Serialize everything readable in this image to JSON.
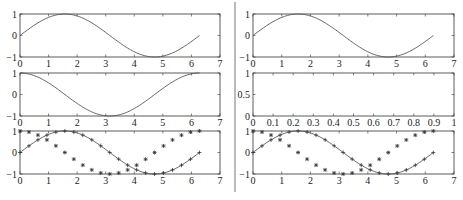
{
  "chart_data": [
    {
      "type": "line",
      "panel": "left-top",
      "title": "",
      "xlabel": "",
      "ylabel": "",
      "xlim": [
        0,
        7
      ],
      "ylim": [
        -1,
        1
      ],
      "xticks": [
        "0",
        "1",
        "2",
        "3",
        "4",
        "5",
        "6",
        "7"
      ],
      "yticks": [
        "-1",
        "0",
        "1"
      ],
      "series": [
        {
          "name": "sin(x)",
          "function": "sin",
          "x_range": [
            0,
            6.283
          ],
          "style": "solid"
        }
      ]
    },
    {
      "type": "line",
      "panel": "left-middle",
      "title": "",
      "xlabel": "",
      "ylabel": "",
      "xlim": [
        0,
        7
      ],
      "ylim": [
        -1,
        1
      ],
      "xticks": [
        "0",
        "1",
        "2",
        "3",
        "4",
        "5",
        "6",
        "7"
      ],
      "yticks": [
        "-1",
        "0",
        "1"
      ],
      "series": [
        {
          "name": "cos(x)",
          "function": "cos",
          "x_range": [
            0,
            6.283
          ],
          "style": "solid"
        }
      ]
    },
    {
      "type": "line",
      "panel": "left-bottom",
      "title": "",
      "xlabel": "",
      "ylabel": "",
      "xlim": [
        0,
        7
      ],
      "ylim": [
        -1,
        1
      ],
      "xticks": [
        "0",
        "1",
        "2",
        "3",
        "4",
        "5",
        "6",
        "7"
      ],
      "yticks": [
        "-1",
        "0",
        "1"
      ],
      "series": [
        {
          "name": "sin(x)",
          "function": "sin",
          "x_range": [
            0,
            6.283
          ],
          "style": "solid",
          "marker": "+",
          "marker_step": 0.314
        },
        {
          "name": "cos(x)",
          "function": "cos",
          "x_range": [
            0,
            6.283
          ],
          "style": "none",
          "marker": "*",
          "marker_step": 0.314
        }
      ]
    },
    {
      "type": "line",
      "panel": "right-top",
      "title": "",
      "xlabel": "",
      "ylabel": "",
      "xlim": [
        0,
        7
      ],
      "ylim": [
        -1,
        1
      ],
      "xticks": [
        "0",
        "1",
        "2",
        "3",
        "4",
        "5",
        "6",
        "7"
      ],
      "yticks": [
        "-1",
        "0",
        "1"
      ],
      "series": [
        {
          "name": "sin(x)",
          "function": "sin",
          "x_range": [
            0,
            6.283
          ],
          "style": "solid"
        }
      ]
    },
    {
      "type": "line",
      "panel": "right-middle",
      "title": "",
      "xlabel": "",
      "ylabel": "",
      "xlim": [
        0,
        1
      ],
      "ylim": [
        0,
        1
      ],
      "xticks": [
        "0",
        "0.1",
        "0.2",
        "0.3",
        "0.4",
        "0.5",
        "0.6",
        "0.7",
        "0.8",
        "0.9",
        "1"
      ],
      "yticks": [
        "0",
        "0.5",
        "1"
      ],
      "series": []
    },
    {
      "type": "line",
      "panel": "right-bottom",
      "title": "",
      "xlabel": "",
      "ylabel": "",
      "xlim": [
        0,
        7
      ],
      "ylim": [
        -1,
        1
      ],
      "xticks": [
        "0",
        "1",
        "2",
        "3",
        "4",
        "5",
        "6",
        "7"
      ],
      "yticks": [
        "-1",
        "0",
        "1"
      ],
      "series": [
        {
          "name": "sin(x)",
          "function": "sin",
          "x_range": [
            0,
            6.283
          ],
          "style": "solid",
          "marker": "+",
          "marker_step": 0.314
        },
        {
          "name": "cos(x)",
          "function": "cos",
          "x_range": [
            0,
            6.283
          ],
          "style": "none",
          "marker": "*",
          "marker_step": 0.314
        }
      ]
    }
  ],
  "layout": {
    "panels": [
      {
        "x0": 20,
        "x1": 220,
        "y0": 14,
        "y1": 57
      },
      {
        "x0": 20,
        "x1": 220,
        "y0": 73,
        "y1": 116
      },
      {
        "x0": 20,
        "x1": 220,
        "y0": 131,
        "y1": 174
      },
      {
        "x0": 253,
        "x1": 454,
        "y0": 14,
        "y1": 57
      },
      {
        "x0": 253,
        "x1": 454,
        "y0": 73,
        "y1": 116
      },
      {
        "x0": 253,
        "x1": 454,
        "y0": 131,
        "y1": 174
      }
    ],
    "divider_x": 235
  }
}
